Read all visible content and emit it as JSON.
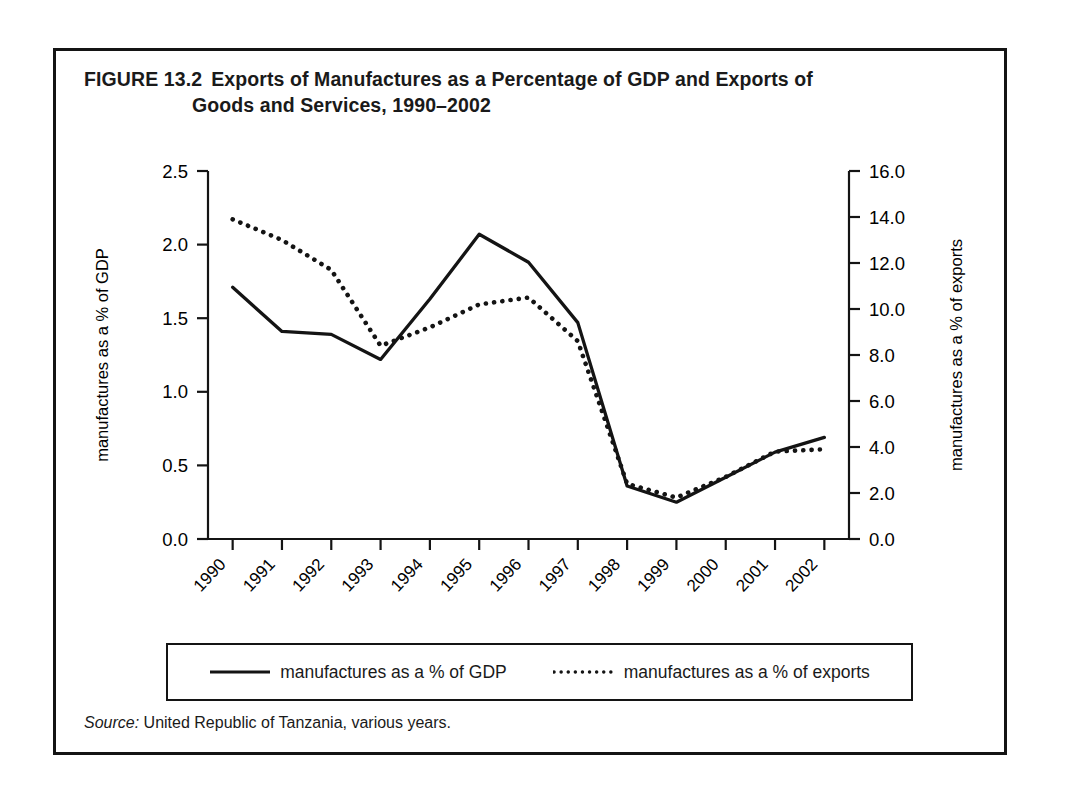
{
  "figure": {
    "number": "FIGURE 13.2",
    "title_line1": "Exports of Manufactures as a Percentage of GDP and Exports of",
    "title_line2": "Goods and Services, 1990–2002",
    "source_word": "Source:",
    "source_text": " United Republic of Tanzania, various years."
  },
  "legend": {
    "items": [
      {
        "label": "manufactures as a % of GDP",
        "style": "solid"
      },
      {
        "label": "manufactures as a % of exports",
        "style": "dotted"
      }
    ]
  },
  "chart_data": {
    "type": "line",
    "xlabel": "year",
    "categories": [
      "1990",
      "1991",
      "1992",
      "1993",
      "1994",
      "1995",
      "1996",
      "1997",
      "1998",
      "1999",
      "2000",
      "2001",
      "2002"
    ],
    "x": [
      1990,
      1991,
      1992,
      1993,
      1994,
      1995,
      1996,
      1997,
      1998,
      1999,
      2000,
      2001,
      2002
    ],
    "grid": false,
    "legend_position": "bottom",
    "axes": {
      "left": {
        "label": "manufactures as a % of GDP",
        "ticks": [
          "0.0",
          "0.5",
          "1.0",
          "1.5",
          "2.0",
          "2.5"
        ],
        "tick_values": [
          0.0,
          0.5,
          1.0,
          1.5,
          2.0,
          2.5
        ],
        "ylim": [
          0.0,
          2.5
        ]
      },
      "right": {
        "label": "manufactures as a % of exports",
        "ticks": [
          "0.0",
          "2.0",
          "4.0",
          "6.0",
          "8.0",
          "10.0",
          "12.0",
          "14.0",
          "16.0"
        ],
        "tick_values": [
          0.0,
          2.0,
          4.0,
          6.0,
          8.0,
          10.0,
          12.0,
          14.0,
          16.0
        ],
        "ylim": [
          0.0,
          16.0
        ]
      }
    },
    "series": [
      {
        "name": "manufactures as a % of GDP",
        "axis": "left",
        "style": "solid",
        "values": [
          1.71,
          1.41,
          1.39,
          1.22,
          1.63,
          2.07,
          1.88,
          1.47,
          0.36,
          0.25,
          0.42,
          0.59,
          0.69
        ]
      },
      {
        "name": "manufactures as a % of exports",
        "axis": "right",
        "style": "dotted",
        "values": [
          13.9,
          13.0,
          11.7,
          8.4,
          9.2,
          10.2,
          10.5,
          8.6,
          2.4,
          1.8,
          2.7,
          3.8,
          3.9
        ]
      }
    ]
  }
}
